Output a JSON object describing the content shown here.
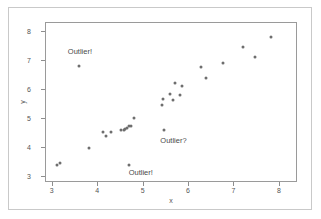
{
  "chart_data": {
    "type": "scatter",
    "title": "",
    "subtitle": "",
    "xlabel": "x",
    "ylabel": "y",
    "xlim": [
      2.85,
      8.4
    ],
    "ylim": [
      2.78,
      8.3
    ],
    "xticks": [
      3,
      4,
      5,
      6,
      7,
      8
    ],
    "yticks": [
      3,
      4,
      5,
      6,
      7,
      8
    ],
    "xticklabels": [
      "3",
      "4",
      "5",
      "6",
      "7",
      "8"
    ],
    "yticklabels": [
      "3",
      "4",
      "5",
      "6",
      "7",
      "8"
    ],
    "grid": false,
    "legend": null,
    "marker_color": "#6e6e6e",
    "frame_color": "#9a9a9a",
    "points": [
      {
        "x": 3.12,
        "y": 3.38
      },
      {
        "x": 3.18,
        "y": 3.44
      },
      {
        "x": 3.6,
        "y": 6.78
      },
      {
        "x": 3.82,
        "y": 3.95
      },
      {
        "x": 4.12,
        "y": 4.5
      },
      {
        "x": 4.2,
        "y": 4.36
      },
      {
        "x": 4.3,
        "y": 4.5
      },
      {
        "x": 4.52,
        "y": 4.56
      },
      {
        "x": 4.58,
        "y": 4.58
      },
      {
        "x": 4.62,
        "y": 4.6
      },
      {
        "x": 4.66,
        "y": 4.66
      },
      {
        "x": 4.7,
        "y": 4.7
      },
      {
        "x": 4.74,
        "y": 4.72
      },
      {
        "x": 4.7,
        "y": 3.36
      },
      {
        "x": 4.8,
        "y": 5.0
      },
      {
        "x": 5.42,
        "y": 5.44
      },
      {
        "x": 5.44,
        "y": 5.64
      },
      {
        "x": 5.46,
        "y": 4.56
      },
      {
        "x": 5.6,
        "y": 5.8
      },
      {
        "x": 5.66,
        "y": 5.62
      },
      {
        "x": 5.72,
        "y": 6.18
      },
      {
        "x": 5.82,
        "y": 5.78
      },
      {
        "x": 5.86,
        "y": 6.08
      },
      {
        "x": 6.28,
        "y": 6.74
      },
      {
        "x": 6.4,
        "y": 6.36
      },
      {
        "x": 6.76,
        "y": 6.9
      },
      {
        "x": 7.2,
        "y": 7.44
      },
      {
        "x": 7.48,
        "y": 7.1
      },
      {
        "x": 7.82,
        "y": 7.78
      }
    ],
    "annotations": [
      {
        "text": "Outlier!",
        "x": 3.62,
        "y": 7.3
      },
      {
        "text": "Outlier?",
        "x": 5.68,
        "y": 4.22
      },
      {
        "text": "Outlier!",
        "x": 4.96,
        "y": 3.12
      }
    ]
  }
}
